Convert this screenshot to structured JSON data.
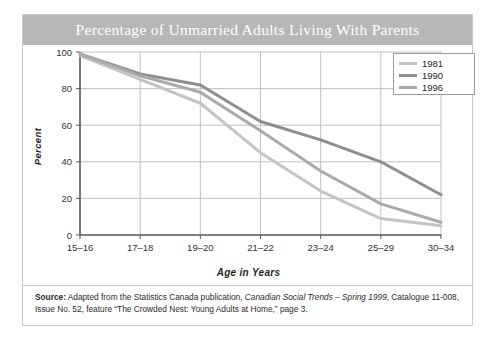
{
  "card": {
    "title": "Percentage of Unmarried Adults Living With Parents"
  },
  "source": {
    "label": "Source:",
    "text_part1": " Adapted from the Statistics Canada publication, ",
    "italic1": "Canadian Social Trends – Spring 1999",
    "text_part2": ", Catalogue 11-008, Issue No. 52, feature “The Crowded Nest: Young Adults at Home,” page 3."
  },
  "legend": {
    "entries": [
      {
        "label": "1981",
        "color": "#c4c4c4"
      },
      {
        "label": "1990",
        "color": "#8e8e8e"
      },
      {
        "label": "1996",
        "color": "#aaaaaa"
      }
    ]
  },
  "chart_data": {
    "type": "line",
    "title": "Percentage of Unmarried Adults Living With Parents",
    "xlabel": "Age in Years",
    "ylabel": "Percent",
    "categories": [
      "15–16",
      "17–18",
      "19–20",
      "21–22",
      "23–24",
      "25–29",
      "30–34"
    ],
    "ylim": [
      0,
      100
    ],
    "yticks": [
      0,
      20,
      40,
      60,
      80,
      100
    ],
    "grid": true,
    "legend_position": "top-right",
    "series": [
      {
        "name": "1981",
        "color": "#c4c4c4",
        "values": [
          98,
          85,
          72,
          45,
          24,
          9,
          5
        ]
      },
      {
        "name": "1990",
        "color": "#8e8e8e",
        "values": [
          99,
          88,
          82,
          62,
          52,
          40,
          22
        ]
      },
      {
        "name": "1996",
        "color": "#aaaaaa",
        "values": [
          99,
          87,
          78,
          57,
          35,
          17,
          7
        ]
      }
    ]
  }
}
